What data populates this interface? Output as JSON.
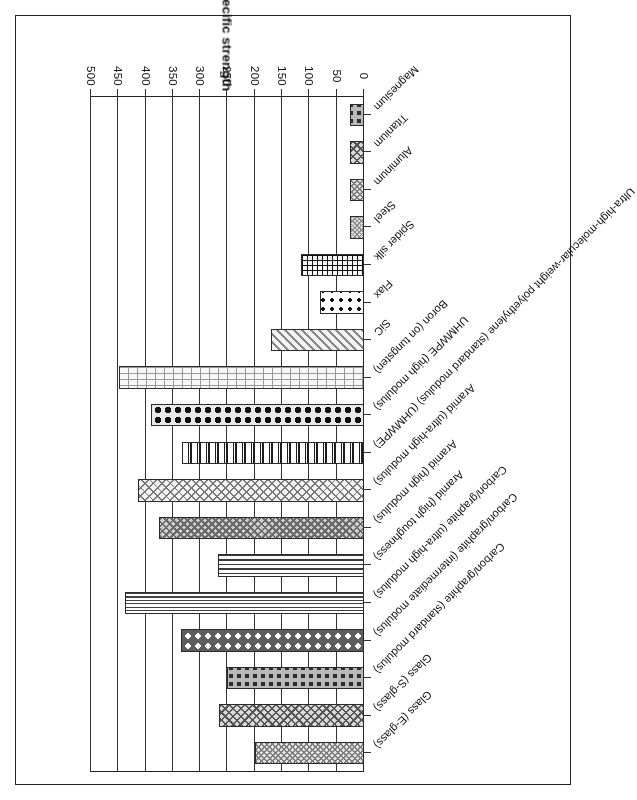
{
  "chart_data": {
    "type": "bar",
    "title": "",
    "orientation": "horizontal",
    "rotated_180": true,
    "xlabel": "",
    "ylabel": "Specific strength",
    "axis_title": "Specific strength",
    "xlim": [
      0,
      500
    ],
    "xticks": [
      500,
      450,
      400,
      350,
      300,
      250,
      200,
      150,
      100,
      50,
      0
    ],
    "tick_labels": [
      "500",
      "450",
      "400",
      "350",
      "300",
      "250",
      "200",
      "150",
      "100",
      "50",
      "0"
    ],
    "grid": true,
    "legend": "none",
    "categories": [
      "Glass (E-glass)",
      "Glass (S-glass)",
      "Carbon/graphite (standard modulus)",
      "Carbon/graphite (intermediate modulus)",
      "Carbon/graphite (ultra-high modulus)",
      "Aramid (high toughness)",
      "Aramid (high modulus)",
      "Aramid (ultra-high modulus)",
      "Ultra-high-molecular-weight polyethylene (standard modulus) (UHMWPE)",
      "UHMWPE (high modulus)",
      "Boron (on tungsten)",
      "SiC",
      "Flax",
      "Spider silk",
      "Steel",
      "Aluminum",
      "Titanium",
      "Magnesium"
    ],
    "values": [
      200,
      265,
      250,
      335,
      438,
      267,
      376,
      414,
      334,
      390,
      448,
      170,
      80,
      115,
      25,
      25,
      25,
      25
    ],
    "pattern_names": [
      "crosshatch-fine",
      "crosshatch-medium",
      "dots-dark-on-grey",
      "circles-white-on-grey",
      "horizontal-lines-dense",
      "horizontal-lines",
      "crosshatch-bold",
      "crosshatch-light",
      "vertical-bars-mixed",
      "dots-black-large",
      "brick",
      "diagonal-stripe",
      "dice-dots",
      "grid-dots",
      "solid-grey-speckle"
    ],
    "colors": {
      "bar_outline": "#2b2b2b",
      "axis": "#222222",
      "grid": "#333333",
      "text": "#111111",
      "background": "#ffffff"
    }
  }
}
